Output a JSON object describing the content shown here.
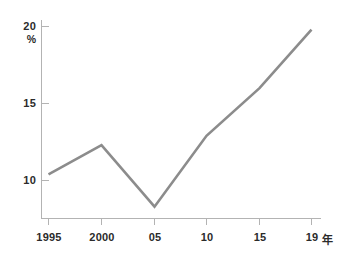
{
  "chart_data": {
    "type": "line",
    "title": "",
    "subtitle": "",
    "xlabel": "",
    "ylabel": "%",
    "x_axis_suffix": "年",
    "categories": [
      "1995",
      "2000",
      "05",
      "10",
      "15",
      "19"
    ],
    "x_values": [
      1995,
      2000,
      2005,
      2010,
      2015,
      2019
    ],
    "values": [
      10.4,
      12.3,
      8.3,
      12.9,
      16.0,
      19.8
    ],
    "series": [
      {
        "name": "",
        "values": [
          10.4,
          12.3,
          8.3,
          12.9,
          16.0,
          19.8
        ]
      }
    ],
    "y_ticks": [
      10,
      15,
      20
    ],
    "y_tick_labels": [
      "10",
      "15",
      "20"
    ],
    "ylim": [
      7.0,
      20.0
    ],
    "xlim": [
      1995,
      2019
    ],
    "grid": false,
    "legend": false,
    "legend_position": "none",
    "line_color": "#8c8c8c",
    "axis_color": "#b3b3b3",
    "text_color": "#2b2b2b",
    "background_color": "#ffffff"
  },
  "axis": {
    "y_unit_label": "%",
    "y_top_label": "20",
    "y_mid_label": "15",
    "y_bottom_label": "10",
    "x_labels": {
      "t0": "1995",
      "t1": "2000",
      "t2": "05",
      "t3": "10",
      "t4": "15",
      "t5": "19"
    },
    "x_suffix": "年"
  }
}
